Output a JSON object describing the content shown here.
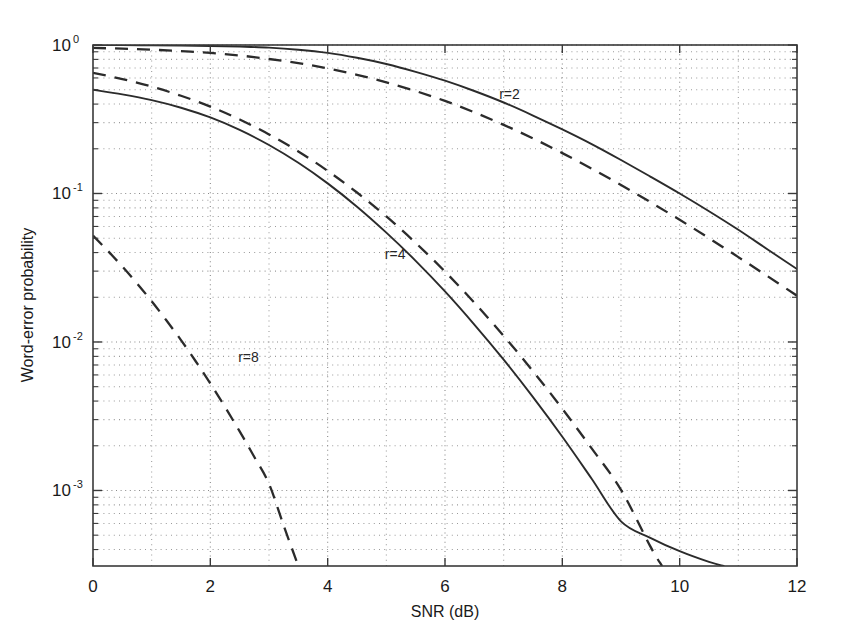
{
  "chart_data": {
    "type": "line",
    "title": "",
    "xlabel": "SNR (dB)",
    "ylabel": "Word-error probability",
    "xlim": [
      0,
      12
    ],
    "ylim": [
      0.00031,
      1.0
    ],
    "yscale": "log",
    "xscale": "linear",
    "grid": true,
    "grid_style": "dotted",
    "legend": "none",
    "xticks": [
      0,
      2,
      4,
      6,
      8,
      10,
      12
    ],
    "xtick_labels": [
      "0",
      "2",
      "4",
      "6",
      "8",
      "10",
      "12"
    ],
    "yticks": [
      1,
      0.1,
      0.01,
      0.001
    ],
    "ytick_labels": [
      "10^0",
      "10^-1",
      "10^-2",
      "10^-3"
    ],
    "ytick_mantissas": [
      "10",
      "10",
      "10",
      "10"
    ],
    "ytick_exponents": [
      "0",
      "-1",
      "-2",
      "-3"
    ],
    "annotations": [
      {
        "text": "r=2",
        "x": 7.1,
        "y": 0.43
      },
      {
        "text": "r=4",
        "x": 5.15,
        "y": 0.036
      },
      {
        "text": "r=8",
        "x": 2.65,
        "y": 0.0073
      }
    ],
    "series": [
      {
        "name": "r=2 solid",
        "style": "solid",
        "x": [
          0,
          0.5,
          1,
          1.5,
          2,
          2.5,
          3,
          3.5,
          4,
          4.5,
          5,
          5.5,
          6,
          6.5,
          7,
          7.5,
          8,
          8.5,
          9,
          9.5,
          10,
          10.5,
          11,
          11.5,
          12
        ],
        "y": [
          1.0,
          1.0,
          0.995,
          0.99,
          0.985,
          0.975,
          0.96,
          0.93,
          0.885,
          0.82,
          0.745,
          0.66,
          0.575,
          0.49,
          0.41,
          0.335,
          0.27,
          0.215,
          0.168,
          0.13,
          0.1,
          0.076,
          0.057,
          0.042,
          0.031
        ]
      },
      {
        "name": "r=2 dashed",
        "style": "dashed",
        "x": [
          0,
          0.5,
          1,
          1.5,
          2,
          2.5,
          3,
          3.5,
          4,
          4.5,
          5,
          5.5,
          6,
          6.5,
          7,
          7.5,
          8,
          8.5,
          9,
          9.5,
          10,
          10.5,
          11,
          11.5,
          12
        ],
        "y": [
          0.955,
          0.945,
          0.93,
          0.91,
          0.885,
          0.85,
          0.805,
          0.755,
          0.695,
          0.63,
          0.56,
          0.49,
          0.42,
          0.352,
          0.29,
          0.235,
          0.187,
          0.147,
          0.114,
          0.0875,
          0.0665,
          0.05,
          0.0373,
          0.0277,
          0.0205
        ]
      },
      {
        "name": "r=4 solid",
        "style": "solid",
        "x": [
          0,
          0.5,
          1,
          1.5,
          2,
          2.5,
          3,
          3.5,
          4,
          4.5,
          5,
          5.5,
          6,
          6.5,
          7,
          7.5,
          8,
          8.5,
          9,
          9.5,
          10,
          10.5,
          10.75
        ],
        "y": [
          0.5,
          0.465,
          0.425,
          0.378,
          0.325,
          0.268,
          0.212,
          0.161,
          0.117,
          0.0815,
          0.0545,
          0.0352,
          0.0219,
          0.0131,
          0.0076,
          0.00425,
          0.0023,
          0.0012,
          0.00062,
          0.00048,
          0.00039,
          0.00033,
          0.00031
        ]
      },
      {
        "name": "r=4 dashed",
        "style": "dashed",
        "x": [
          0,
          0.5,
          1,
          1.5,
          2,
          2.5,
          3,
          3.5,
          4,
          4.5,
          5,
          5.5,
          6,
          6.5,
          7,
          7.5,
          8,
          8.5,
          9,
          9.5,
          9.7
        ],
        "y": [
          0.65,
          0.59,
          0.525,
          0.455,
          0.385,
          0.315,
          0.25,
          0.192,
          0.142,
          0.1015,
          0.07,
          0.0465,
          0.0298,
          0.0184,
          0.011,
          0.00635,
          0.00355,
          0.00192,
          0.00101,
          0.00042,
          0.00031
        ]
      },
      {
        "name": "r=8 dashed",
        "style": "dashed",
        "x": [
          0,
          0.25,
          0.5,
          0.75,
          1,
          1.25,
          1.5,
          1.75,
          2,
          2.25,
          2.5,
          2.75,
          3,
          3.25,
          3.5
        ],
        "y": [
          0.052,
          0.0412,
          0.0322,
          0.0248,
          0.0188,
          0.014,
          0.0103,
          0.00742,
          0.00525,
          0.00365,
          0.0025,
          0.00168,
          0.00111,
          0.00058,
          0.00031
        ]
      }
    ]
  },
  "figure": {
    "plot_left": 93,
    "plot_right": 797,
    "plot_top": 45,
    "plot_bottom": 566
  }
}
